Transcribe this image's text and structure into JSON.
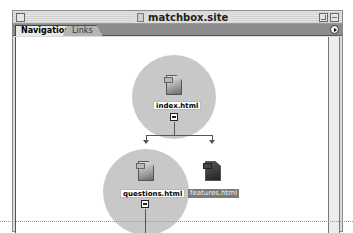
{
  "window": {
    "title": "matchbox.site"
  },
  "tabs": [
    {
      "label": "Navigation",
      "active": true
    },
    {
      "label": "Links",
      "active": false
    }
  ],
  "site_map": {
    "root": {
      "label": "index.html",
      "expanded": true
    },
    "children": [
      {
        "label": "questions.html",
        "expanded": true,
        "selected": false
      },
      {
        "label": "features.html",
        "selected": true
      }
    ]
  },
  "colors": {
    "node_circle": "#c8c8c8",
    "tab_bar": "#8c8c8c",
    "selected_label": "#7a7a7a"
  }
}
